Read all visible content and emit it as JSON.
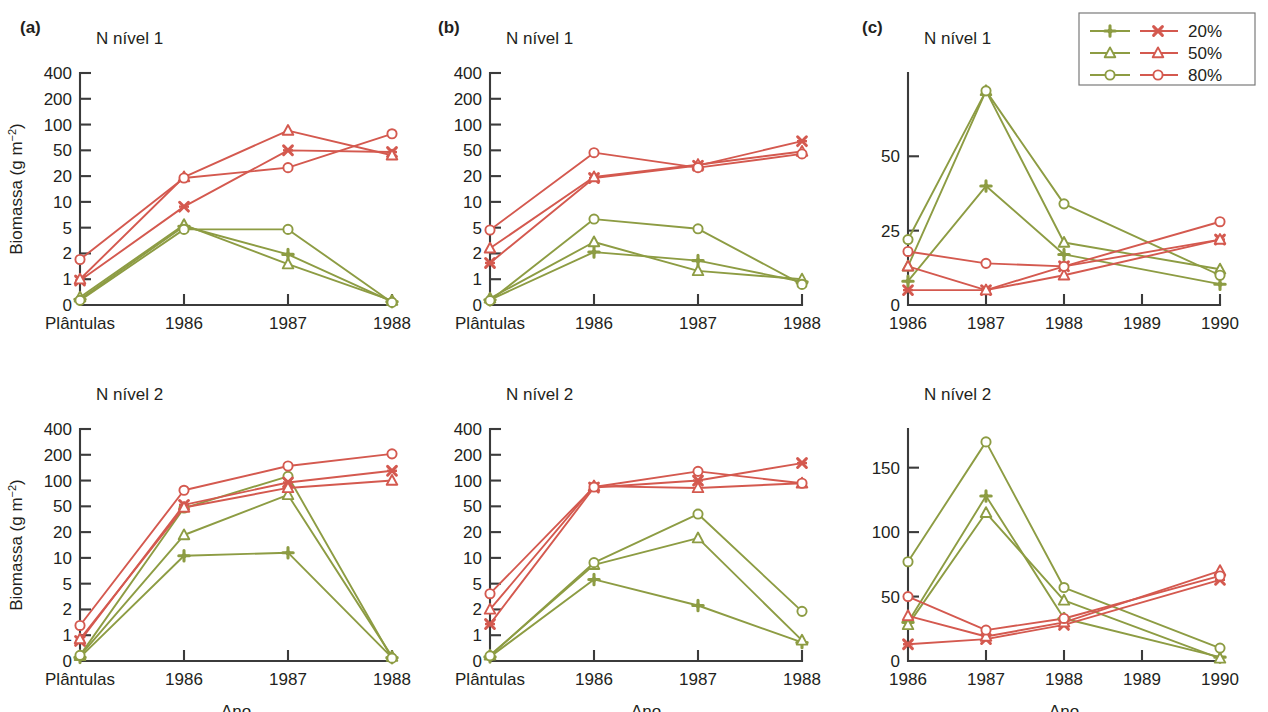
{
  "figure": {
    "axis_label_y": "Biomassa (g m",
    "axis_label_y_sup": "−2",
    "axis_label_y_close": ")",
    "axis_label_x": "Ano",
    "colors": {
      "green": "#8d9c43",
      "red": "#d4594f",
      "axis": "#3b3b3b",
      "text": "#231f20"
    }
  },
  "legend": {
    "position": "top-right",
    "entries": [
      {
        "label": "20%",
        "green_marker": "plus",
        "red_marker": "cross"
      },
      {
        "label": "50%",
        "green_marker": "triangle",
        "red_marker": "triangle"
      },
      {
        "label": "80%",
        "green_marker": "circle",
        "red_marker": "circle"
      }
    ]
  },
  "chart_data": [
    {
      "id": "a-top",
      "panel_letter": "(a)",
      "type": "line",
      "title": "N nível 1",
      "xlabel": "",
      "ylabel": "Biomassa (g m−2)",
      "yscale": "log-like",
      "categories": [
        "Plântulas",
        "1986",
        "1987",
        "1988"
      ],
      "yticks": [
        0,
        1,
        2,
        5,
        10,
        20,
        50,
        100,
        200,
        400
      ],
      "ylim": [
        0,
        400
      ],
      "grid": false,
      "series": [
        {
          "name": "green 20%",
          "color": "#8d9c43",
          "marker": "plus",
          "values": [
            0.22,
            5.2,
            1.95,
            0.13
          ]
        },
        {
          "name": "green 50%",
          "color": "#8d9c43",
          "marker": "triangle",
          "values": [
            0.3,
            5.4,
            1.5,
            0.17
          ]
        },
        {
          "name": "green 80%",
          "color": "#8d9c43",
          "marker": "circle",
          "values": [
            0.18,
            4.7,
            4.7,
            0.1
          ]
        },
        {
          "name": "red 20%",
          "color": "#d4594f",
          "marker": "cross",
          "values": [
            0.95,
            8.8,
            50,
            47
          ]
        },
        {
          "name": "red 50%",
          "color": "#d4594f",
          "marker": "triangle",
          "values": [
            1.0,
            19.5,
            85,
            42
          ]
        },
        {
          "name": "red 80%",
          "color": "#d4594f",
          "marker": "circle",
          "values": [
            1.7,
            19.0,
            27,
            78
          ]
        }
      ]
    },
    {
      "id": "a-bottom",
      "panel_letter": "",
      "type": "line",
      "title": "N nível 2",
      "xlabel": "Ano",
      "ylabel": "Biomassa (g m−2)",
      "yscale": "log-like",
      "categories": [
        "Plântulas",
        "1986",
        "1987",
        "1988"
      ],
      "yticks": [
        0,
        1,
        2,
        5,
        10,
        20,
        50,
        100,
        200,
        400
      ],
      "ylim": [
        0,
        400
      ],
      "grid": false,
      "series": [
        {
          "name": "green 20%",
          "color": "#8d9c43",
          "marker": "plus",
          "values": [
            0.14,
            10.6,
            11.5,
            0.13
          ]
        },
        {
          "name": "green 50%",
          "color": "#8d9c43",
          "marker": "triangle",
          "values": [
            0.2,
            18.5,
            68,
            0.17
          ]
        },
        {
          "name": "green 80%",
          "color": "#8d9c43",
          "marker": "circle",
          "values": [
            0.22,
            47,
            112,
            0.11
          ]
        },
        {
          "name": "red 20%",
          "color": "#d4594f",
          "marker": "cross",
          "values": [
            0.78,
            52,
            95,
            130
          ]
        },
        {
          "name": "red 50%",
          "color": "#d4594f",
          "marker": "triangle",
          "values": [
            0.85,
            48,
            82,
            100
          ]
        },
        {
          "name": "red 80%",
          "color": "#d4594f",
          "marker": "circle",
          "values": [
            1.3,
            77,
            148,
            205
          ]
        }
      ]
    },
    {
      "id": "b-top",
      "panel_letter": "(b)",
      "type": "line",
      "title": "N nível 1",
      "xlabel": "",
      "ylabel": "",
      "yscale": "log-like",
      "categories": [
        "Plântulas",
        "1986",
        "1987",
        "1988"
      ],
      "yticks": [
        0,
        1,
        2,
        5,
        10,
        20,
        50,
        100,
        200,
        400
      ],
      "ylim": [
        0,
        400
      ],
      "grid": false,
      "series": [
        {
          "name": "green 20%",
          "color": "#8d9c43",
          "marker": "plus",
          "values": [
            0.2,
            2.1,
            1.65,
            0.9
          ]
        },
        {
          "name": "green 50%",
          "color": "#8d9c43",
          "marker": "triangle",
          "values": [
            0.26,
            3.0,
            1.25,
            1.0
          ]
        },
        {
          "name": "green 80%",
          "color": "#8d9c43",
          "marker": "circle",
          "values": [
            0.17,
            6.3,
            4.8,
            0.8
          ]
        },
        {
          "name": "red 20%",
          "color": "#d4594f",
          "marker": "cross",
          "values": [
            1.55,
            19.0,
            29,
            64
          ]
        },
        {
          "name": "red 50%",
          "color": "#d4594f",
          "marker": "triangle",
          "values": [
            2.4,
            19.5,
            30,
            48
          ]
        },
        {
          "name": "red 80%",
          "color": "#d4594f",
          "marker": "circle",
          "values": [
            4.6,
            46,
            27,
            44
          ]
        }
      ]
    },
    {
      "id": "b-bottom",
      "panel_letter": "",
      "type": "line",
      "title": "N nível 2",
      "xlabel": "Ano",
      "ylabel": "",
      "yscale": "log-like",
      "categories": [
        "Plântulas",
        "1986",
        "1987",
        "1988"
      ],
      "yticks": [
        0,
        1,
        2,
        5,
        10,
        20,
        50,
        100,
        200,
        400
      ],
      "ylim": [
        0,
        400
      ],
      "grid": false,
      "series": [
        {
          "name": "green 20%",
          "color": "#8d9c43",
          "marker": "plus",
          "values": [
            0.16,
            5.6,
            2.3,
            0.72
          ]
        },
        {
          "name": "green 50%",
          "color": "#8d9c43",
          "marker": "triangle",
          "values": [
            0.22,
            8.3,
            17,
            0.8
          ]
        },
        {
          "name": "green 80%",
          "color": "#8d9c43",
          "marker": "circle",
          "values": [
            0.2,
            8.8,
            38,
            1.9
          ]
        },
        {
          "name": "red 20%",
          "color": "#d4594f",
          "marker": "cross",
          "values": [
            1.35,
            83,
            100,
            160
          ]
        },
        {
          "name": "red 50%",
          "color": "#d4594f",
          "marker": "triangle",
          "values": [
            2.0,
            86,
            82,
            93
          ]
        },
        {
          "name": "red 80%",
          "color": "#d4594f",
          "marker": "circle",
          "values": [
            3.5,
            84,
            128,
            93
          ]
        }
      ]
    },
    {
      "id": "c-top",
      "panel_letter": "(c)",
      "type": "line",
      "title": "N nível 1",
      "xlabel": "",
      "ylabel": "",
      "yscale": "linear",
      "categories": [
        "1986",
        "1987",
        "1988",
        "1989",
        "1990"
      ],
      "yticks": [
        0,
        25,
        50
      ],
      "ylim": [
        0,
        78
      ],
      "grid": false,
      "series": [
        {
          "name": "green 20%",
          "color": "#8d9c43",
          "marker": "plus",
          "values": [
            8,
            40,
            17,
            null,
            7
          ]
        },
        {
          "name": "green 50%",
          "color": "#8d9c43",
          "marker": "triangle",
          "values": [
            13,
            72,
            21,
            null,
            12
          ]
        },
        {
          "name": "green 80%",
          "color": "#8d9c43",
          "marker": "circle",
          "values": [
            22,
            72,
            34,
            null,
            10
          ]
        },
        {
          "name": "red 20%",
          "color": "#d4594f",
          "marker": "cross",
          "values": [
            5,
            5,
            13,
            null,
            22
          ]
        },
        {
          "name": "red 50%",
          "color": "#d4594f",
          "marker": "triangle",
          "values": [
            13,
            5,
            10,
            null,
            22
          ]
        },
        {
          "name": "red 80%",
          "color": "#d4594f",
          "marker": "circle",
          "values": [
            18,
            14,
            13,
            null,
            28
          ]
        }
      ]
    },
    {
      "id": "c-bottom",
      "panel_letter": "",
      "type": "line",
      "title": "N nível 2",
      "xlabel": "Ano",
      "ylabel": "",
      "yscale": "linear",
      "categories": [
        "1986",
        "1987",
        "1988",
        "1989",
        "1990"
      ],
      "yticks": [
        0,
        50,
        100,
        150
      ],
      "ylim": [
        0,
        180
      ],
      "grid": false,
      "series": [
        {
          "name": "green 20%",
          "color": "#8d9c43",
          "marker": "plus",
          "values": [
            30,
            128,
            33,
            null,
            3
          ]
        },
        {
          "name": "green 50%",
          "color": "#8d9c43",
          "marker": "triangle",
          "values": [
            28,
            115,
            47,
            null,
            2
          ]
        },
        {
          "name": "green 80%",
          "color": "#8d9c43",
          "marker": "circle",
          "values": [
            77,
            170,
            57,
            null,
            10
          ]
        },
        {
          "name": "red 20%",
          "color": "#d4594f",
          "marker": "cross",
          "values": [
            13,
            17,
            28,
            null,
            63
          ]
        },
        {
          "name": "red 50%",
          "color": "#d4594f",
          "marker": "triangle",
          "values": [
            35,
            19,
            30,
            null,
            70
          ]
        },
        {
          "name": "red 80%",
          "color": "#d4594f",
          "marker": "circle",
          "values": [
            50,
            24,
            33,
            null,
            66
          ]
        }
      ]
    }
  ]
}
